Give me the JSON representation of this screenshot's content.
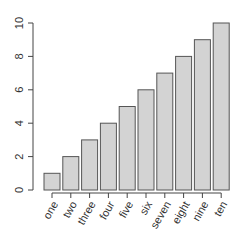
{
  "chart_data": {
    "type": "bar",
    "title": "",
    "xlabel": "",
    "ylabel": "",
    "categories": [
      "one",
      "two",
      "three",
      "four",
      "five",
      "six",
      "seven",
      "eight",
      "nine",
      "ten"
    ],
    "values": [
      1,
      2,
      3,
      4,
      5,
      6,
      7,
      8,
      9,
      10
    ],
    "ylim": [
      0,
      10
    ],
    "yticks": [
      0,
      2,
      4,
      6,
      8,
      10
    ],
    "grid": false,
    "bar_color": "#d3d3d3",
    "bar_edge_color": "#555555"
  }
}
